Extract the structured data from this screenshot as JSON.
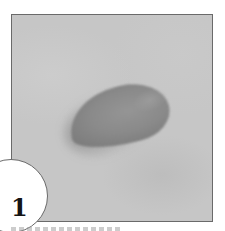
{
  "figure": {
    "number": "1",
    "colors": {
      "background": "#c6c6c6",
      "object": "#858585",
      "border": "#6a6a6a",
      "number": "#141414"
    }
  }
}
